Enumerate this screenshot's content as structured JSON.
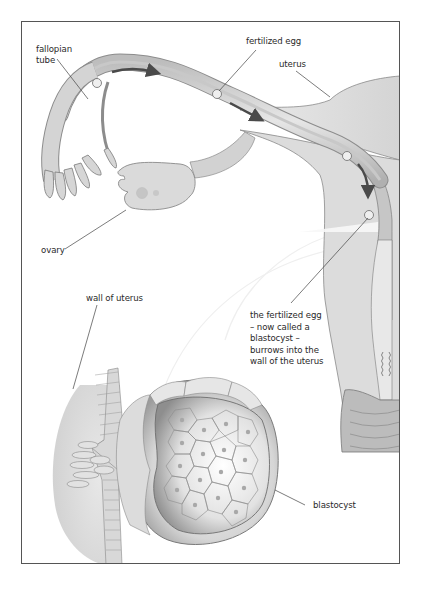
{
  "diagram": {
    "type": "anatomical-illustration",
    "labels": {
      "fallopian_tube": "fallopian\ntube",
      "fertilized_egg": "fertilized egg",
      "uterus": "uterus",
      "ovary": "ovary",
      "wall_of_uterus": "wall of uterus",
      "blastocyst_caption": "the fertilized egg\n– now called a\nblastocyst –\nburrows into the\nwall of the uterus",
      "blastocyst": "blastocyst"
    },
    "colors": {
      "frame": "#555555",
      "tissue_light": "#e4e4e4",
      "tissue_mid": "#cfcfcf",
      "tissue_dark": "#9a9a9a",
      "outline": "#7a7a7a",
      "arrow": "#4a4a4a",
      "leader_line": "#444444",
      "label_text": "#2a2a2a"
    }
  }
}
